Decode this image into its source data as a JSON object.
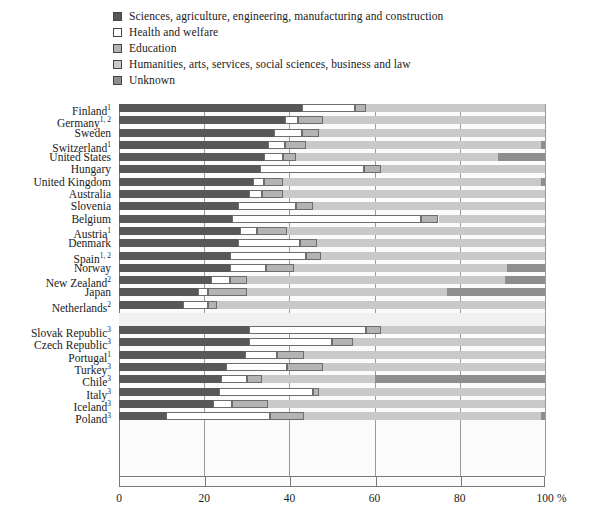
{
  "chart_data": {
    "type": "bar",
    "orientation": "horizontal",
    "stacked": true,
    "title": "",
    "xlabel": "%",
    "ylabel": "",
    "xlim": [
      0,
      100
    ],
    "grid": true,
    "legend_position": "top-left",
    "xticks": [
      0,
      20,
      40,
      60,
      80,
      100
    ],
    "xticklabels": [
      "0",
      "20",
      "40",
      "60",
      "80",
      "100"
    ],
    "series": [
      {
        "name": "Sciences, agriculture, engineering, manufacturing and construction",
        "key": "sciences",
        "color": "#585858"
      },
      {
        "name": "Health and welfare",
        "key": "health",
        "color": "#ffffff"
      },
      {
        "name": "Education",
        "key": "education",
        "color": "#b4b4b4"
      },
      {
        "name": "Humanities, arts, services, social sciences, business and law",
        "key": "humanities",
        "color": "#c9c9c9"
      },
      {
        "name": "Unknown",
        "key": "unknown",
        "color": "#8e8e8e"
      }
    ],
    "groups": [
      {
        "name": "group-1",
        "categories": [
          {
            "label": "Finland",
            "note": "1",
            "values": [
              43.0,
              12.5,
              2.5,
              42.0,
              0.0
            ]
          },
          {
            "label": "Germany",
            "note": "1, 2",
            "values": [
              39.0,
              3.0,
              6.0,
              52.0,
              0.0
            ]
          },
          {
            "label": "Sweden",
            "note": "",
            "values": [
              36.5,
              6.5,
              4.0,
              53.0,
              0.0
            ]
          },
          {
            "label": "Switzerland",
            "note": "1",
            "values": [
              35.0,
              4.0,
              5.0,
              55.0,
              1.0
            ]
          },
          {
            "label": "United States",
            "note": "",
            "values": [
              34.0,
              4.5,
              3.0,
              47.5,
              11.0
            ]
          },
          {
            "label": "Hungary",
            "note": "",
            "values": [
              33.0,
              24.5,
              4.0,
              38.5,
              0.0
            ]
          },
          {
            "label": "United Kingdom",
            "note": "",
            "values": [
              31.5,
              2.5,
              4.5,
              60.5,
              1.0
            ]
          },
          {
            "label": "Australia",
            "note": "",
            "values": [
              30.5,
              3.0,
              5.0,
              61.5,
              0.0
            ]
          },
          {
            "label": "Slovenia",
            "note": "",
            "values": [
              28.0,
              13.5,
              4.0,
              54.5,
              0.0
            ]
          },
          {
            "label": "Belgium",
            "note": "",
            "values": [
              26.5,
              44.5,
              4.0,
              25.0,
              0.0
            ]
          },
          {
            "label": "Austria",
            "note": "1",
            "values": [
              28.5,
              4.0,
              7.0,
              60.5,
              0.0
            ]
          },
          {
            "label": "Denmark",
            "note": "",
            "values": [
              28.0,
              14.5,
              4.0,
              53.5,
              0.0
            ]
          },
          {
            "label": "Spain",
            "note": "1, 2",
            "values": [
              26.0,
              18.0,
              3.5,
              52.5,
              0.0
            ]
          },
          {
            "label": "Norway",
            "note": "",
            "values": [
              26.0,
              8.5,
              6.5,
              50.0,
              9.0
            ]
          },
          {
            "label": "New Zealand",
            "note": "2",
            "values": [
              21.5,
              4.5,
              4.0,
              60.5,
              9.5
            ]
          },
          {
            "label": "Japan",
            "note": "",
            "values": [
              18.5,
              2.5,
              9.0,
              47.0,
              23.0
            ]
          },
          {
            "label": "Netherlands",
            "note": "2",
            "values": [
              15.0,
              6.0,
              2.0,
              77.0,
              0.0
            ]
          }
        ]
      },
      {
        "name": "group-2",
        "categories": [
          {
            "label": "Slovak Republic",
            "note": "3",
            "values": [
              30.5,
              27.5,
              3.5,
              38.5,
              0.0
            ]
          },
          {
            "label": "Czech Republic",
            "note": "3",
            "values": [
              30.5,
              19.5,
              5.0,
              45.0,
              0.0
            ]
          },
          {
            "label": "Portugal",
            "note": "1",
            "values": [
              29.5,
              7.5,
              6.5,
              56.5,
              0.0
            ]
          },
          {
            "label": "Turkey",
            "note": "3",
            "values": [
              25.0,
              14.5,
              8.5,
              52.0,
              0.0
            ]
          },
          {
            "label": "Chile",
            "note": "3",
            "values": [
              24.0,
              6.0,
              3.5,
              26.5,
              40.0
            ]
          },
          {
            "label": "Italy",
            "note": "3",
            "values": [
              23.5,
              22.0,
              1.5,
              53.0,
              0.0
            ]
          },
          {
            "label": "Iceland",
            "note": "3",
            "values": [
              22.0,
              4.5,
              8.5,
              65.0,
              0.0
            ]
          },
          {
            "label": "Poland",
            "note": "3",
            "values": [
              11.0,
              24.5,
              8.0,
              55.5,
              1.0
            ]
          }
        ]
      }
    ]
  }
}
